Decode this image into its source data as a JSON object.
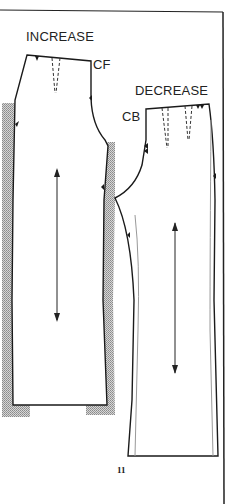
{
  "labels": {
    "increase": "INCREASE",
    "cf": "CF",
    "decrease": "DECREASE",
    "cb": "CB"
  },
  "page_number": "11",
  "colors": {
    "line": "#1a1a1a",
    "shade": "#b8b8b8"
  }
}
